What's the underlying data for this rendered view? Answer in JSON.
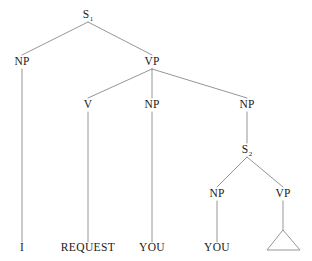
{
  "figure": {
    "kind": "syntax-tree-diagram",
    "sentence": "I REQUEST YOU YOU",
    "background_color": "#ffffff",
    "line_color": "#8a8a8a",
    "text_color": "#1a1a1a"
  },
  "nodes": {
    "s1": {
      "label": "S",
      "subscript": "1",
      "x": 88,
      "y": 15
    },
    "np_subject": {
      "label": "NP",
      "x": 22,
      "y": 62
    },
    "vp_main": {
      "label": "VP",
      "x": 152,
      "y": 62
    },
    "v": {
      "label": "V",
      "x": 88,
      "y": 105
    },
    "np_object": {
      "label": "NP",
      "x": 152,
      "y": 105
    },
    "np_clause": {
      "label": "NP",
      "x": 247,
      "y": 105
    },
    "s2": {
      "label": "S",
      "subscript": "2",
      "x": 247,
      "y": 150
    },
    "np_embedded": {
      "label": "NP",
      "x": 217,
      "y": 194
    },
    "vp_embedded": {
      "label": "VP",
      "x": 283,
      "y": 194
    }
  },
  "terminals": {
    "i": {
      "label": "I",
      "x": 22,
      "y": 248
    },
    "request": {
      "label": "REQUEST",
      "x": 88,
      "y": 248
    },
    "you_object": {
      "label": "YOU",
      "x": 152,
      "y": 248
    },
    "you_embedded": {
      "label": "YOU",
      "x": 217,
      "y": 248
    }
  },
  "triangle": {
    "name": "elided-vp-triangle",
    "apex_x": 283,
    "apex_y": 230,
    "left_x": 267,
    "right_x": 300,
    "base_y": 250
  },
  "edges": [
    {
      "from": "s1",
      "to": "np_subject",
      "x1": 88,
      "y1": 22,
      "x2": 22,
      "y2": 55
    },
    {
      "from": "s1",
      "to": "vp_main",
      "x1": 88,
      "y1": 22,
      "x2": 152,
      "y2": 55
    },
    {
      "from": "np_subject",
      "to": "i",
      "x1": 22,
      "y1": 69,
      "x2": 22,
      "y2": 242
    },
    {
      "from": "vp_main",
      "to": "v",
      "x1": 152,
      "y1": 69,
      "x2": 88,
      "y2": 98
    },
    {
      "from": "vp_main",
      "to": "np_object",
      "x1": 152,
      "y1": 69,
      "x2": 152,
      "y2": 98
    },
    {
      "from": "vp_main",
      "to": "np_clause",
      "x1": 152,
      "y1": 69,
      "x2": 247,
      "y2": 98
    },
    {
      "from": "v",
      "to": "request",
      "x1": 88,
      "y1": 112,
      "x2": 88,
      "y2": 242
    },
    {
      "from": "np_object",
      "to": "you_object",
      "x1": 152,
      "y1": 112,
      "x2": 152,
      "y2": 242
    },
    {
      "from": "np_clause",
      "to": "s2",
      "x1": 247,
      "y1": 112,
      "x2": 247,
      "y2": 143
    },
    {
      "from": "s2",
      "to": "np_embedded",
      "x1": 247,
      "y1": 157,
      "x2": 217,
      "y2": 187
    },
    {
      "from": "s2",
      "to": "vp_embedded",
      "x1": 247,
      "y1": 157,
      "x2": 283,
      "y2": 187
    },
    {
      "from": "np_embedded",
      "to": "you_embedded",
      "x1": 217,
      "y1": 201,
      "x2": 217,
      "y2": 242
    },
    {
      "from": "vp_embedded",
      "to": "triangle",
      "x1": 283,
      "y1": 201,
      "x2": 283,
      "y2": 230
    }
  ]
}
